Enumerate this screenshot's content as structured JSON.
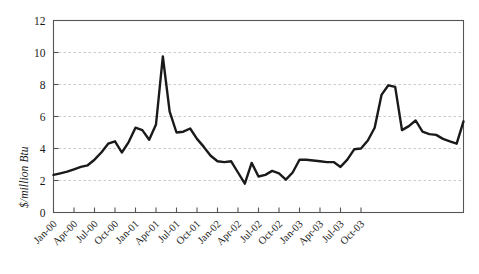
{
  "chart_data": {
    "type": "line",
    "title": "",
    "xlabel": "",
    "ylabel": "$/million Btu",
    "ylim": [
      0,
      12
    ],
    "ytick_values": [
      0,
      2,
      4,
      6,
      8,
      10,
      12
    ],
    "ytick_labels": [
      "0",
      "2",
      "4",
      "6",
      "8",
      "10",
      "12"
    ],
    "grid": "horizontal-dashed",
    "legend": "none",
    "xtick_labels": [
      "Jan-00",
      "Apr-00",
      "Jul-00",
      "Oct-00",
      "Jan-01",
      "Apr-01",
      "Jul-01",
      "Oct-01",
      "Jan-02",
      "Apr-02",
      "Jul-02",
      "Oct-02",
      "Jan-03",
      "Apr-03",
      "Jul-03",
      "Oct-03"
    ],
    "xtick_indices": [
      0,
      3,
      6,
      9,
      12,
      15,
      18,
      21,
      24,
      27,
      30,
      33,
      36,
      39,
      42,
      45
    ],
    "x": [
      "Jan-00",
      "Feb-00",
      "Mar-00",
      "Apr-00",
      "May-00",
      "Jun-00",
      "Jul-00",
      "Aug-00",
      "Sep-00",
      "Oct-00",
      "Nov-00",
      "Dec-00",
      "Jan-01",
      "Feb-01",
      "Mar-01",
      "Apr-01",
      "May-01",
      "Jun-01",
      "Jul-01",
      "Aug-01",
      "Sep-01",
      "Oct-01",
      "Nov-01",
      "Dec-01",
      "Jan-02",
      "Feb-02",
      "Mar-02",
      "Apr-02",
      "May-02",
      "Jun-02",
      "Jul-02",
      "Aug-02",
      "Sep-02",
      "Oct-02",
      "Nov-02",
      "Dec-02",
      "Jan-03",
      "Feb-03",
      "Mar-03",
      "Apr-03",
      "May-03",
      "Jun-03",
      "Jul-03",
      "Aug-03",
      "Sep-03",
      "Oct-03",
      "Nov-03",
      "Dec-03"
    ],
    "values": [
      2.35,
      2.45,
      2.55,
      2.7,
      2.85,
      2.95,
      3.3,
      3.75,
      4.3,
      4.45,
      3.75,
      4.4,
      5.3,
      5.15,
      4.55,
      5.5,
      9.75,
      6.3,
      5.0,
      5.05,
      5.25,
      4.6,
      4.1,
      3.55,
      3.2,
      3.15,
      3.2,
      2.5,
      1.8,
      3.1,
      2.25,
      2.35,
      2.6,
      2.45,
      2.05,
      2.5,
      3.3,
      3.3,
      3.25,
      3.2,
      3.15,
      3.15,
      2.85,
      3.3,
      3.95,
      4.0,
      4.5,
      5.3
    ],
    "values_tail": [
      7.35,
      7.95,
      7.85,
      5.15,
      5.4,
      5.75,
      5.05,
      4.9,
      4.85,
      4.6,
      4.45,
      4.3,
      5.7
    ],
    "series_note": "monthly natural gas price, Jan-2000 through Dec-2003",
    "line_color": "#1a1a1a",
    "line_width": 2.4,
    "grid_color": "#bbbbbb",
    "axis_color": "#555555",
    "background": "#ffffff"
  }
}
